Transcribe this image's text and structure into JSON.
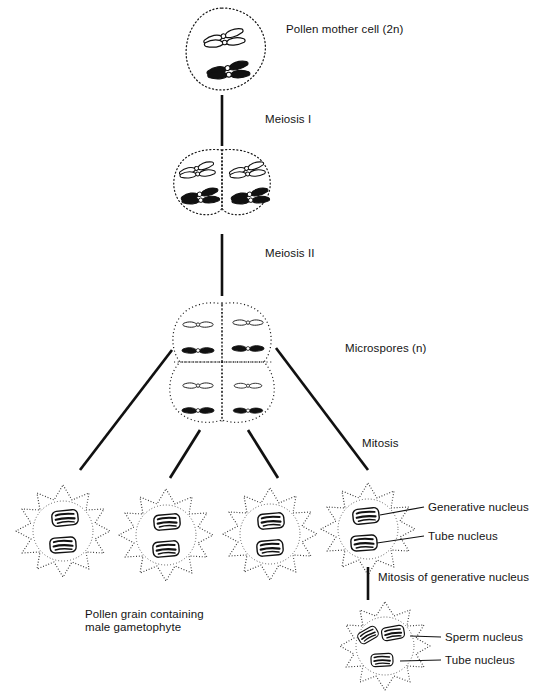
{
  "figure": {
    "background_color": "#ffffff",
    "ink_color": "#111111",
    "white_chromosome_color": "#ffffff",
    "black_chromosome_color": "#111111"
  },
  "labels": {
    "pollen_mother_cell": "Pollen mother cell (2n)",
    "meiosis_1": "Meiosis I",
    "meiosis_2": "Meiosis II",
    "microspores": "Microspores (n)",
    "mitosis": "Mitosis",
    "generative_nucleus": "Generative nucleus",
    "tube_nucleus": "Tube nucleus",
    "mitosis_of_generative_nucleus": "Mitosis of generative nucleus",
    "pollen_grain_caption_line1": "Pollen grain containing",
    "pollen_grain_caption_line2": "male gametophyte",
    "sperm_nucleus": "Sperm nucleus",
    "tube_nucleus_2": "Tube nucleus"
  },
  "stages": [
    {
      "id": "pollen-mother-cell",
      "name": "Pollen mother cell (2n)",
      "cells": 1,
      "chromosome_pairs": 2,
      "description": "single diploid cell with two homologous bivalents, one outlined pair and one solid pair"
    },
    {
      "id": "dyad",
      "name": "Product of Meiosis I",
      "cells": 2,
      "chromosomes_per_cell": 2,
      "description": "two joined cells, each containing one outlined and one solid chromosome"
    },
    {
      "id": "tetrad",
      "name": "Microspores (n)",
      "cells": 4,
      "chromosomes_per_cell": 2,
      "description": "tetrad of four haploid microspores arranged two by two"
    },
    {
      "id": "pollen-grains",
      "name": "Pollen grain containing male gametophyte",
      "cells": 4,
      "nuclei_per_cell": 2,
      "nuclei": [
        "Generative nucleus",
        "Tube nucleus"
      ],
      "description": "four spiny pollen grains, each with a generative nucleus and a tube nucleus"
    },
    {
      "id": "mature-pollen-grain",
      "name": "Mature pollen grain after mitosis of generative nucleus",
      "cells": 1,
      "nuclei_per_cell": 3,
      "nuclei": [
        "Sperm nucleus",
        "Sperm nucleus",
        "Tube nucleus"
      ],
      "description": "pollen grain with two sperm nuclei and one tube nucleus"
    }
  ],
  "flow": [
    {
      "from": "pollen-mother-cell",
      "to": "dyad",
      "label": "Meiosis I"
    },
    {
      "from": "dyad",
      "to": "tetrad",
      "label": "Meiosis II"
    },
    {
      "from": "tetrad",
      "to": "pollen-grains",
      "label": "Mitosis"
    },
    {
      "from": "pollen-grains",
      "to": "mature-pollen-grain",
      "label": "Mitosis of generative nucleus"
    }
  ]
}
